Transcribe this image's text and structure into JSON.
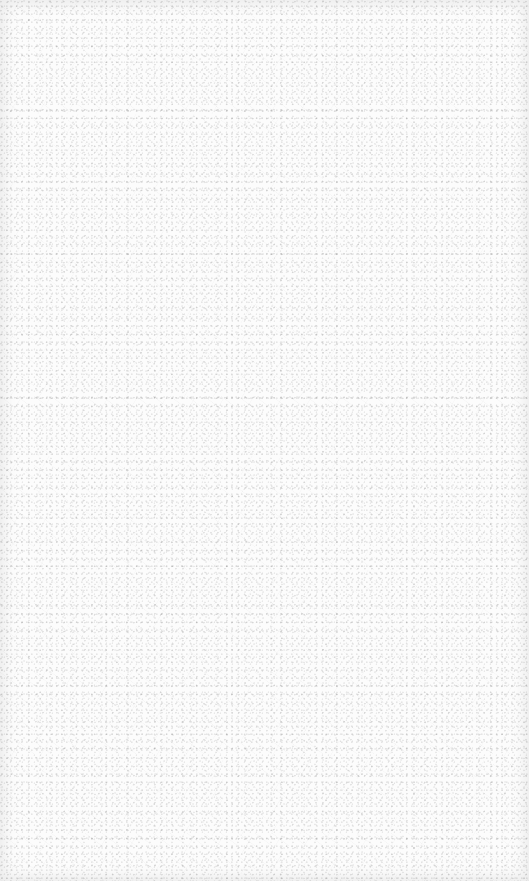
{
  "surface": {
    "description": "Plain white speckled textured surface",
    "base_color": "#fcfcfc",
    "speckle_color": "#c8c8c8",
    "edge_shade_color": "#e6e6e6"
  }
}
